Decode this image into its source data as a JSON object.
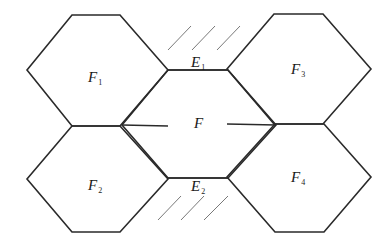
{
  "diagram": {
    "type": "hexagonal-tiling",
    "faces": [
      {
        "id": "F1",
        "label": "F",
        "sub": "1",
        "points": "72,15 120,15 168,70 120,126 72,126 27,70",
        "lx": 88,
        "ly": 82
      },
      {
        "id": "F2",
        "label": "F",
        "sub": "2",
        "points": "72,126 120,126 168,179 120,232 72,232 27,179",
        "lx": 88,
        "ly": 190
      },
      {
        "id": "F3",
        "label": "F",
        "sub": "3",
        "points": "274,14 323,14 371,69 323,124 274,124 227,69",
        "lx": 291,
        "ly": 74
      },
      {
        "id": "F4",
        "label": "F",
        "sub": "4",
        "points": "275,124 324,124 371,177 324,232 275,232 227,177",
        "lx": 291,
        "ly": 182
      },
      {
        "id": "F",
        "label": "F",
        "sub": "",
        "points": "168,70 228,70 276,125 228,178 168,178 122,125",
        "lx": 194,
        "ly": 128
      }
    ],
    "edges": [
      {
        "id": "E1",
        "label": "E",
        "sub": "1",
        "x1": 168,
        "y1": 70,
        "x2": 228,
        "y2": 70,
        "lx": 191,
        "ly": 67
      },
      {
        "id": "E2",
        "label": "E",
        "sub": "2",
        "x1": 168,
        "y1": 178,
        "x2": 228,
        "y2": 178,
        "lx": 191,
        "ly": 191
      },
      {
        "id": "E-left",
        "label": "",
        "sub": "",
        "x1": 122,
        "y1": 125,
        "x2": 168,
        "y2": 126
      },
      {
        "id": "E-right",
        "label": "",
        "sub": "",
        "x1": 276,
        "y1": 125,
        "x2": 227,
        "y2": 124
      }
    ],
    "hatches": [
      {
        "x1": 168,
        "y1": 50,
        "x2": 191,
        "y2": 26
      },
      {
        "x1": 192,
        "y1": 50,
        "x2": 215,
        "y2": 26
      },
      {
        "x1": 217,
        "y1": 50,
        "x2": 240,
        "y2": 26
      },
      {
        "x1": 158,
        "y1": 220,
        "x2": 181,
        "y2": 196
      },
      {
        "x1": 181,
        "y1": 220,
        "x2": 204,
        "y2": 196
      },
      {
        "x1": 204,
        "y1": 220,
        "x2": 228,
        "y2": 196
      }
    ]
  }
}
